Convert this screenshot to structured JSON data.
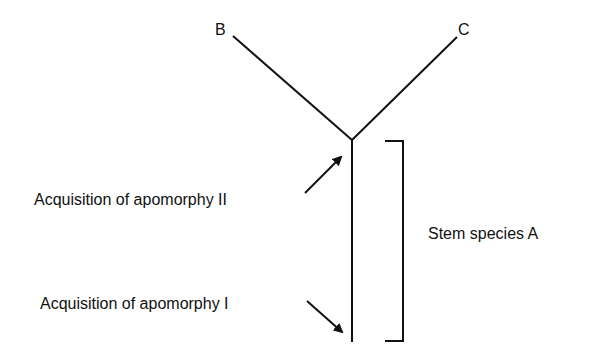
{
  "diagram": {
    "type": "cladogram",
    "nodes": {
      "b": "B",
      "c": "C"
    },
    "labels": {
      "apomorphy_2": "Acquisition of apomorphy II",
      "apomorphy_1": "Acquisition of apomorphy I",
      "stem": "Stem species A"
    },
    "colors": {
      "line": "#111111",
      "background": "#ffffff"
    }
  }
}
